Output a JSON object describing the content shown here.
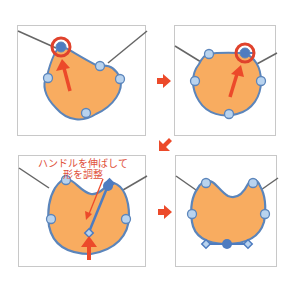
{
  "diagram": {
    "colors": {
      "shape_fill": "#f8ac60",
      "shape_stroke": "#5b85bb",
      "point_fill": "#b9d3ee",
      "point_selected": "#4e7cc0",
      "highlight_ring": "#e0422c",
      "arrow": "#ec4a2a",
      "wire": "#666666",
      "panel_border": "#c8c8c8"
    },
    "panels": [
      {
        "id": 1,
        "label": "select-top-left-point"
      },
      {
        "id": 2,
        "label": "select-top-right-point"
      },
      {
        "id": 3,
        "label": "drag-bottom-handle"
      },
      {
        "id": 4,
        "label": "result-shape"
      }
    ],
    "caption": {
      "line1": "ハンドルを伸ばして",
      "line2": "形を調整"
    },
    "flow_arrows": [
      {
        "from": 1,
        "to": 2,
        "direction": "right"
      },
      {
        "from": 2,
        "to": 3,
        "direction": "down-left"
      },
      {
        "from": 3,
        "to": 4,
        "direction": "right"
      }
    ]
  }
}
